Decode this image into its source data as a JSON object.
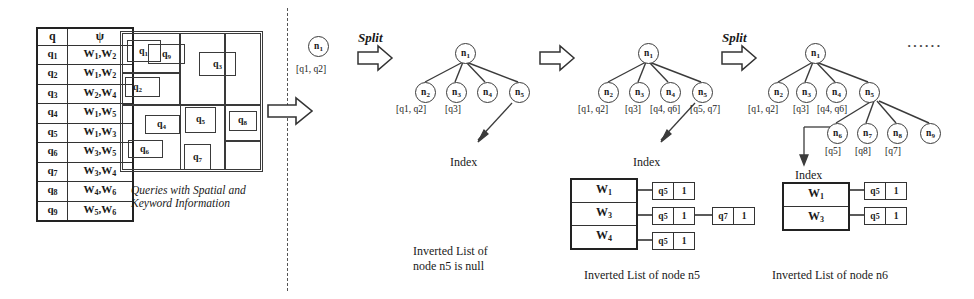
{
  "query_table": {
    "headers": [
      "q",
      "ψ"
    ],
    "rows": [
      {
        "q": "q",
        "qs": "1",
        "w": "W",
        "ws1": "1",
        "w2": "W",
        "ws2": "2"
      },
      {
        "q": "q",
        "qs": "2",
        "w": "W",
        "ws1": "1",
        "w2": "W",
        "ws2": "2"
      },
      {
        "q": "q",
        "qs": "3",
        "w": "W",
        "ws1": "2",
        "w2": "W",
        "ws2": "4"
      },
      {
        "q": "q",
        "qs": "4",
        "w": "W",
        "ws1": "1",
        "w2": "W",
        "ws2": "5"
      },
      {
        "q": "q",
        "qs": "5",
        "w": "W",
        "ws1": "1",
        "w2": "W",
        "ws2": "3"
      },
      {
        "q": "q",
        "qs": "6",
        "w": "W",
        "ws1": "3",
        "w2": "W",
        "ws2": "5"
      },
      {
        "q": "q",
        "qs": "7",
        "w": "W",
        "ws1": "3",
        "w2": "W",
        "ws2": "4"
      },
      {
        "q": "q",
        "qs": "8",
        "w": "W",
        "ws1": "4",
        "w2": "W",
        "ws2": "6"
      },
      {
        "q": "q",
        "qs": "9",
        "w": "W",
        "ws1": "5",
        "w2": "W",
        "ws2": "6"
      }
    ]
  },
  "spatial_map": {
    "labels": [
      "q1",
      "q9",
      "q3",
      "q2",
      "q4",
      "q5",
      "q8",
      "q6",
      "q7"
    ],
    "caption_line1": "Queries with Spatial and",
    "caption_line2": "Keyword Information"
  },
  "split_labels": {
    "first": "Split",
    "second": "Split"
  },
  "stage0": {
    "root": "n1",
    "root_label": "[q1, q2]"
  },
  "stage1": {
    "root": "n1",
    "children": [
      "n2",
      "n3",
      "n4",
      "n5"
    ],
    "child_labels": [
      "[q1, q2]",
      "[q3]",
      "",
      ""
    ],
    "index_caption": "Index",
    "list_caption_line1": "Inverted List of",
    "list_caption_line2": "node n5 is null"
  },
  "stage2": {
    "root": "n1",
    "children": [
      "n2",
      "n3",
      "n4",
      "n5"
    ],
    "child_labels": [
      "[q1, q2]",
      "[q3]",
      "[q4, q6]",
      "[q5, q7]"
    ],
    "index_caption": "Index",
    "list_caption": "Inverted List of node n5",
    "inverted_list": {
      "terms": [
        "W1",
        "W3",
        "W4"
      ],
      "postings": [
        [
          {
            "q": "q5",
            "n": "1"
          }
        ],
        [
          {
            "q": "q5",
            "n": "1"
          },
          {
            "q": "q7",
            "n": "1"
          }
        ],
        [
          {
            "q": "q5",
            "n": "1"
          }
        ]
      ]
    }
  },
  "stage3": {
    "root": "n1",
    "children": [
      "n2",
      "n3",
      "n4",
      "n5"
    ],
    "child_labels": [
      "[q1, q2]",
      "[q3]",
      "[q4, q6]",
      ""
    ],
    "grandchildren": [
      "n6",
      "n7",
      "n8",
      "n9"
    ],
    "grandchild_labels": [
      "[q5]",
      "[q8]",
      "[q7]",
      ""
    ],
    "ellipsis": "······",
    "index_caption": "Index",
    "list_caption": "Inverted List of node n6",
    "inverted_list": {
      "terms": [
        "W1",
        "W3"
      ],
      "postings": [
        [
          {
            "q": "q5",
            "n": "1"
          }
        ],
        [
          {
            "q": "q5",
            "n": "1"
          }
        ]
      ]
    }
  },
  "colors": {
    "ink": "#1a1a1a",
    "line": "#333333",
    "background": "#ffffff"
  }
}
